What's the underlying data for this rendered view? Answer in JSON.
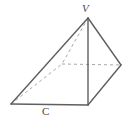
{
  "figure": {
    "kind": "geometry-pyramid-diagram",
    "canvas": {
      "width": 126,
      "height": 123,
      "background": "#ffffff"
    },
    "style": {
      "solid_edge_color": "#5f5f5f",
      "hidden_edge_color": "#a8a8a8",
      "solid_edge_width": 1.4,
      "hidden_edge_width": 1,
      "hidden_edge_dash": "3 3",
      "label_color": "#4a4a4a"
    },
    "labels": {
      "apex": "V",
      "base_front": "C"
    },
    "vertices": {
      "V": {
        "x": 88,
        "y": 18,
        "name": "apex",
        "hidden": false
      },
      "A": {
        "x": 11,
        "y": 104,
        "name": "base-left",
        "hidden": false
      },
      "B": {
        "x": 88,
        "y": 105,
        "name": "base-front",
        "hidden": false
      },
      "D": {
        "x": 121,
        "y": 65,
        "name": "base-right",
        "hidden": false
      },
      "E": {
        "x": 62,
        "y": 64,
        "name": "base-back",
        "hidden": true
      }
    },
    "edges": [
      {
        "from": "V",
        "to": "A",
        "hidden": false,
        "name": "edge-apex-to-base-left"
      },
      {
        "from": "V",
        "to": "B",
        "hidden": false,
        "name": "edge-apex-to-base-front"
      },
      {
        "from": "V",
        "to": "D",
        "hidden": false,
        "name": "edge-apex-to-base-right"
      },
      {
        "from": "V",
        "to": "E",
        "hidden": true,
        "name": "edge-apex-to-base-back"
      },
      {
        "from": "A",
        "to": "B",
        "hidden": false,
        "name": "edge-base-left-to-front"
      },
      {
        "from": "B",
        "to": "D",
        "hidden": false,
        "name": "edge-base-front-to-right"
      },
      {
        "from": "A",
        "to": "E",
        "hidden": true,
        "name": "edge-base-left-to-back"
      },
      {
        "from": "E",
        "to": "D",
        "hidden": true,
        "name": "edge-base-back-to-right"
      }
    ]
  }
}
